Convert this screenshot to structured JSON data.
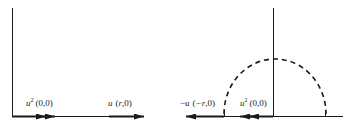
{
  "panels": [
    {
      "name": "left",
      "vector_u2": {
        "symbol": "u",
        "sup": "2",
        "coord": "(0,0)"
      },
      "vector_u": {
        "symbol": "u",
        "coord_open": "(",
        "coord_var": "r",
        "coord_close": ",0)"
      }
    },
    {
      "name": "right",
      "vector_neg_u": {
        "sign": "−",
        "symbol": "u",
        "coord_open": "(",
        "coord_var": "−r",
        "coord_close": ",0)"
      },
      "vector_u2": {
        "symbol": "u",
        "sup": "2",
        "coord": "(0,0)"
      }
    }
  ],
  "colors": {
    "line": "#1a1a1a",
    "text": "#222222"
  }
}
